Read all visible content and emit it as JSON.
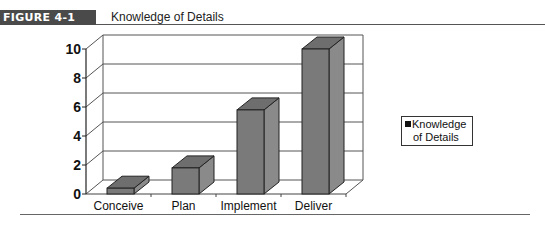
{
  "figure": {
    "label": "FIGURE 4-1",
    "title": "Knowledge of Details"
  },
  "legend": {
    "line1": "Knowledge",
    "line2": "of Details"
  },
  "chart_data": {
    "type": "bar",
    "style": "3d-column",
    "title": "Knowledge of Details",
    "categories": [
      "Conceive",
      "Plan",
      "Implement",
      "Deliver"
    ],
    "series": [
      {
        "name": "Knowledge of Details",
        "values": [
          0.4,
          1.8,
          5.8,
          10
        ],
        "color": "#7a7a7a"
      }
    ],
    "xlabel": "",
    "ylabel": "",
    "ylim": [
      0,
      10
    ],
    "yticks": [
      "0",
      "2",
      "4",
      "6",
      "8",
      "10"
    ],
    "grid": true,
    "legend_position": "right"
  }
}
